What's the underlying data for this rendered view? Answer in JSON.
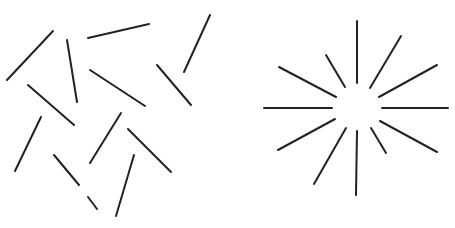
{
  "figure": {
    "stroke_color": "#222222",
    "background": "#ffffff",
    "panels": [
      {
        "name": "scattered-lines",
        "arrangement": "random",
        "segments": [
          [
            53,
            31,
            7,
            80
          ],
          [
            67,
            40,
            77,
            102
          ],
          [
            88,
            38,
            149,
            24
          ],
          [
            210,
            15,
            184,
            72
          ],
          [
            90,
            70,
            145,
            106
          ],
          [
            157,
            65,
            191,
            105
          ],
          [
            28,
            85,
            74,
            125
          ],
          [
            41,
            117,
            15,
            171
          ],
          [
            121,
            113,
            90,
            163
          ],
          [
            128,
            129,
            171,
            172
          ],
          [
            54,
            155,
            79,
            185
          ],
          [
            88,
            197,
            97,
            209
          ],
          [
            134,
            155,
            116,
            216
          ]
        ]
      },
      {
        "name": "radial-starburst",
        "arrangement": "radial",
        "center": [
          357,
          108
        ],
        "segments": [
          [
            357,
            21,
            357,
            83
          ],
          [
            401,
            36,
            370,
            88
          ],
          [
            437,
            65,
            379,
            97
          ],
          [
            326,
            55,
            345,
            87
          ],
          [
            279,
            67,
            336,
            97
          ],
          [
            264,
            108,
            332,
            108
          ],
          [
            382,
            108,
            448,
            108
          ],
          [
            335,
            119,
            278,
            150
          ],
          [
            346,
            128,
            314,
            184
          ],
          [
            357,
            131,
            356,
            195
          ],
          [
            371,
            128,
            386,
            153
          ],
          [
            380,
            121,
            437,
            152
          ]
        ]
      }
    ]
  }
}
